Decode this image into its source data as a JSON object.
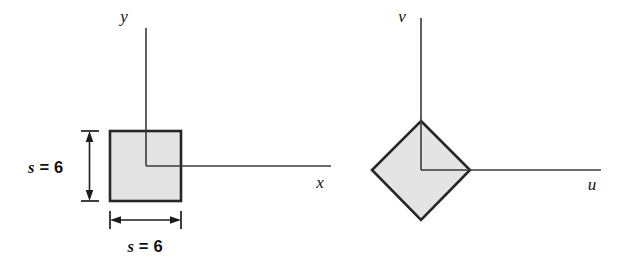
{
  "figure": {
    "background_color": "#ffffff",
    "shape_fill_color": "#e4e4e4",
    "shape_stroke_color": "#262626",
    "axis_color": "#3a3a3a",
    "left_panel": {
      "name": "square-in-xy-axes",
      "axes": {
        "vertical_label": "y",
        "horizontal_label": "x"
      },
      "dimensions": {
        "vertical_label_var": "s",
        "vertical_label_eq": "=",
        "vertical_label_value": "6",
        "vertical_label_full": "s = 6",
        "horizontal_label_var": "s",
        "horizontal_label_eq": "=",
        "horizontal_label_value": "6",
        "horizontal_label_full": "s = 6"
      }
    },
    "right_panel": {
      "name": "rotated-square-in-uv-axes",
      "axes": {
        "vertical_label": "v",
        "horizontal_label": "u"
      }
    }
  }
}
